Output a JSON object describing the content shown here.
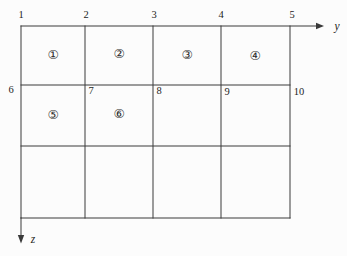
{
  "figure": {
    "type": "mesh-grid-diagram",
    "axes": {
      "y_label": "y",
      "z_label": "z"
    },
    "node_numbers": [
      "1",
      "2",
      "3",
      "4",
      "5",
      "6",
      "7",
      "8",
      "9",
      "10"
    ],
    "element_numbers": [
      "①",
      "②",
      "③",
      "④",
      "⑤",
      "⑥"
    ],
    "grid": {
      "columns": 4,
      "rows": 3
    },
    "colors": {
      "line": "#3a3a3a",
      "text": "#1c1c1c",
      "background": "#fcfcfc"
    }
  }
}
